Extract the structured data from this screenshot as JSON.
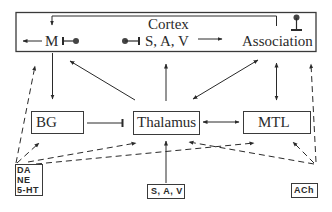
{
  "diagram": {
    "type": "brain-systems-block-diagram",
    "cortex": {
      "title": "Cortex",
      "regions": {
        "motor": "M",
        "sensory": "S, A, V",
        "association": "Association"
      }
    },
    "subcortical": {
      "basal_ganglia": "BG",
      "thalamus": "Thalamus",
      "medial_temporal_lobe": "MTL"
    },
    "inputs": {
      "monoamines": [
        "DA",
        "NE",
        "5-HT"
      ],
      "sensory_input": "S, A, V",
      "cholinergic": "ACh"
    },
    "edges": [
      {
        "from": "Association",
        "to": "M",
        "style": "solid",
        "kind": "feedback-loop"
      },
      {
        "from": "M",
        "to": "output-left",
        "style": "solid",
        "kind": "arrow"
      },
      {
        "from": "S, A, V (cortex)",
        "to": "Association",
        "style": "solid",
        "kind": "arrow"
      },
      {
        "from": "M",
        "to": "BG",
        "style": "solid",
        "kind": "arrow"
      },
      {
        "from": "Thalamus",
        "to": "M",
        "style": "solid",
        "kind": "arrow"
      },
      {
        "from": "Thalamus",
        "to": "S, A, V (cortex)",
        "style": "solid",
        "kind": "arrow"
      },
      {
        "from": "Association",
        "to": "Thalamus",
        "style": "solid",
        "kind": "bidirectional"
      },
      {
        "from": "Association",
        "to": "MTL",
        "style": "solid",
        "kind": "bidirectional"
      },
      {
        "from": "BG",
        "to": "Thalamus",
        "style": "solid",
        "kind": "inhibitory"
      },
      {
        "from": "Thalamus",
        "to": "MTL",
        "style": "solid",
        "kind": "bidirectional"
      },
      {
        "from": "S, A, V (input)",
        "to": "Thalamus",
        "style": "solid",
        "kind": "arrow"
      },
      {
        "from": "DA/NE/5-HT",
        "to": "Cortex",
        "style": "dashed",
        "kind": "arrow"
      },
      {
        "from": "DA/NE/5-HT",
        "to": "BG",
        "style": "dashed",
        "kind": "arrow"
      },
      {
        "from": "DA/NE/5-HT",
        "to": "Thalamus",
        "style": "dashed",
        "kind": "arrow"
      },
      {
        "from": "DA/NE/5-HT",
        "to": "MTL",
        "style": "dashed",
        "kind": "arrow"
      },
      {
        "from": "ACh",
        "to": "Cortex",
        "style": "dashed",
        "kind": "arrow"
      },
      {
        "from": "ACh",
        "to": "MTL",
        "style": "dashed",
        "kind": "arrow"
      },
      {
        "from": "ACh",
        "to": "Thalamus",
        "style": "dashed",
        "kind": "arrow"
      }
    ],
    "local_inhibition_symbols": [
      "M",
      "S, A, V",
      "Association",
      "BG",
      "MTL"
    ]
  }
}
